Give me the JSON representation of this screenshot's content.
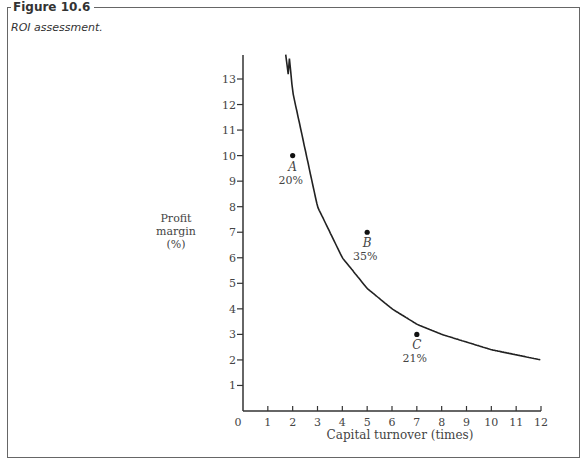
{
  "figure": {
    "title": "Figure 10.6",
    "caption": "ROI assessment."
  },
  "chart_data": {
    "type": "scatter",
    "title": "ROI assessment.",
    "xlabel": "Capital turnover (times)",
    "ylabel": "Profit margin (%)",
    "ylabel_lines": [
      "Profit",
      "margin",
      "(%)"
    ],
    "xlim": [
      0,
      12
    ],
    "ylim": [
      0,
      14
    ],
    "x_ticks": [
      "0",
      "1",
      "2",
      "3",
      "4",
      "5",
      "6",
      "7",
      "8",
      "9",
      "10",
      "11",
      "12"
    ],
    "y_ticks": [
      "1",
      "2",
      "3",
      "4",
      "5",
      "6",
      "7",
      "8",
      "9",
      "10",
      "11",
      "12",
      "13"
    ],
    "grid": false,
    "points": [
      {
        "label": "A",
        "x": 2,
        "y": 10,
        "annotation": "20%"
      },
      {
        "label": "B",
        "x": 5,
        "y": 7,
        "annotation": "35%"
      },
      {
        "label": "C",
        "x": 7,
        "y": 3,
        "annotation": "21%"
      }
    ],
    "series": [
      {
        "name": "ROI curve (margin × turnover = 24%)",
        "type": "line",
        "x": [
          1.85,
          2,
          3,
          4,
          5,
          6,
          7,
          8,
          9,
          10,
          11,
          12
        ],
        "y": [
          14,
          12.5,
          8,
          6,
          4.8,
          4,
          3.4,
          3,
          2.7,
          2.4,
          2.2,
          2.0
        ]
      }
    ]
  }
}
